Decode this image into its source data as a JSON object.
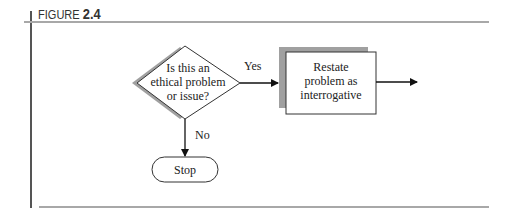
{
  "figure": {
    "label_prefix": "FIGURE ",
    "label_number": "2.4"
  },
  "flowchart": {
    "decision": {
      "lines": [
        "Is this an",
        "ethical problem",
        "or issue?"
      ]
    },
    "yes_label": "Yes",
    "no_label": "No",
    "process": {
      "lines": [
        "Restate",
        "problem as",
        "interrogative"
      ]
    },
    "terminal": {
      "label": "Stop"
    }
  },
  "colors": {
    "shadow": "#a0a0a0",
    "stroke": "#333333",
    "rule": "#a8a8a8"
  }
}
